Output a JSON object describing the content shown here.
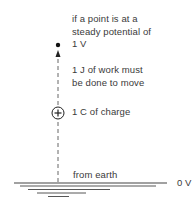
{
  "diagram": {
    "labels": {
      "line1": "if a point is at a",
      "line2": "steady potential of",
      "line3": "1 V",
      "line4": "1 J of work must",
      "line5": "be done to move",
      "line6": "1 C of charge",
      "from_earth": "from earth",
      "zero_volt": "0 V"
    },
    "elements": {
      "point": "point-dot",
      "charge": "positive-charge",
      "path": "dashed-arrow-path",
      "earth": "earth-ground-lines"
    },
    "colors": {
      "ink": "#3a3a3a",
      "background": "#ffffff"
    }
  }
}
